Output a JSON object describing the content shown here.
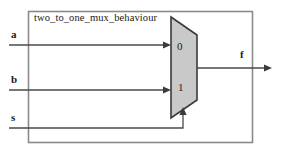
{
  "diagram": {
    "type": "logic-schematic",
    "entity_label": "two_to_one_mux_behaviour",
    "component": {
      "name": "mux-2to1",
      "shape": "trapezoid",
      "fill_color": "#c9c9c9",
      "stroke_color": "#3a3a3a",
      "data_input_labels": [
        "0",
        "1"
      ]
    },
    "ports": {
      "inputs": [
        {
          "name": "a",
          "label": "a",
          "connects_to": "0"
        },
        {
          "name": "b",
          "label": "b",
          "connects_to": "1"
        },
        {
          "name": "s",
          "label": "s",
          "connects_to": "select"
        }
      ],
      "outputs": [
        {
          "name": "f",
          "label": "f"
        }
      ]
    },
    "colors": {
      "background": "#ffffff",
      "border": "#8a8a8a",
      "wire": "#4a4a4a",
      "text": "#1a1a1a"
    }
  }
}
